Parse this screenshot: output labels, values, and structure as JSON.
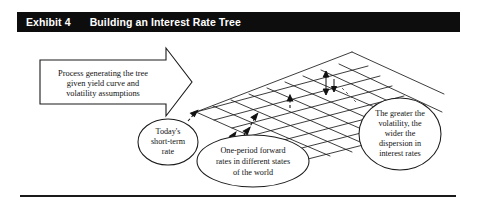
{
  "exhibit": {
    "label": "Exhibit 4",
    "title": "Building an Interest Rate Tree"
  },
  "process_box": {
    "lines": [
      "Process generating the tree",
      "given yield curve and",
      "volatility assumptions"
    ]
  },
  "callouts": [
    {
      "name": "todays-short-term-rate",
      "lines": [
        "Today's",
        "short-term",
        "rate"
      ]
    },
    {
      "name": "one-period-forward-rates",
      "lines": [
        "One-period forward",
        "rates in different states",
        "of the world"
      ]
    },
    {
      "name": "volatility-dispersion",
      "lines": [
        "The greater the",
        "volatility, the",
        "wider the",
        "dispersion in",
        "interest rates"
      ]
    }
  ],
  "colors": {
    "title_bar": "#0d0d0d",
    "title_text": "#ffffff",
    "ink": "#111111",
    "rule": "#1a1a1a",
    "page": "#ffffff"
  }
}
